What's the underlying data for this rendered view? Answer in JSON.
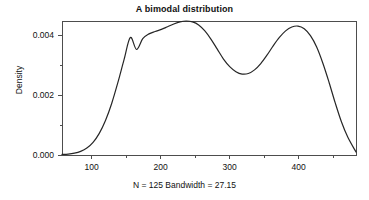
{
  "chart_data": {
    "type": "line",
    "title": "A bimodal distribution",
    "subtitle": "N = 125 Bandwidth = 27.15",
    "xlabel": "N = 125 Bandwidth = 27.15",
    "ylabel": "Density",
    "xlim": [
      57,
      483
    ],
    "ylim": [
      0.0,
      0.00447
    ],
    "grid": false,
    "legend": null,
    "x_ticks": [
      100,
      200,
      300,
      400
    ],
    "x_tick_labels": [
      "100",
      "200",
      "300",
      "400"
    ],
    "x_minor_ticks": [
      50,
      150,
      250,
      350,
      450
    ],
    "y_ticks": [
      0.0,
      0.002,
      0.004
    ],
    "y_tick_labels": [
      "0.000",
      "0.002",
      "0.004"
    ],
    "y_minor_ticks": [
      0.001,
      0.003
    ],
    "series": [
      {
        "name": "density",
        "color": "#262626",
        "x": [
          57,
          66,
          75,
          84,
          93,
          102,
          111,
          120,
          129,
          138,
          147,
          156,
          165,
          174,
          183,
          192,
          201,
          210,
          219,
          228,
          237,
          246,
          255,
          264,
          273,
          282,
          291,
          300,
          309,
          318,
          327,
          336,
          345,
          354,
          363,
          372,
          381,
          390,
          399,
          408,
          417,
          426,
          435,
          444,
          453,
          462,
          471,
          483
        ],
        "y": [
          2e-05,
          3e-05,
          6e-05,
          0.00012,
          0.00023,
          0.00042,
          0.00072,
          0.00115,
          0.00172,
          0.00242,
          0.00319,
          0.00392,
          0.00352,
          0.00388,
          0.00404,
          0.00412,
          0.00419,
          0.00428,
          0.00437,
          0.00444,
          0.00447,
          0.00444,
          0.00434,
          0.00414,
          0.00386,
          0.00353,
          0.0032,
          0.00295,
          0.00278,
          0.0027,
          0.00272,
          0.00284,
          0.00305,
          0.00333,
          0.00364,
          0.00392,
          0.00414,
          0.00427,
          0.0043,
          0.00421,
          0.00398,
          0.0036,
          0.00306,
          0.00242,
          0.00173,
          0.0011,
          0.0006,
          0.0001
        ]
      }
    ]
  },
  "plot": {
    "left": 62,
    "right": 356,
    "top": 21,
    "bottom": 155,
    "axis_color": "#4d4d4d",
    "curve_color": "#262626",
    "curve_width": 1.2
  }
}
